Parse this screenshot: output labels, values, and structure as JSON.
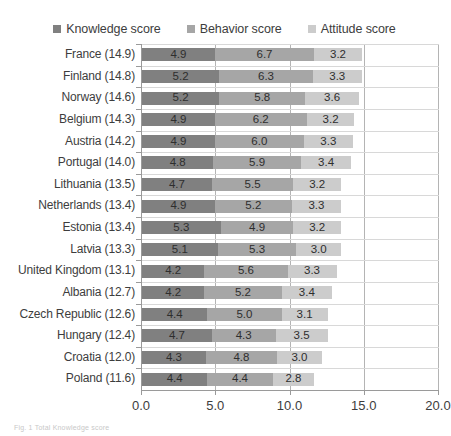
{
  "legend": {
    "items": [
      {
        "label": "Knowledge score",
        "color": "#808080",
        "key": "knowledge"
      },
      {
        "label": "Behavior score",
        "color": "#a6a6a6",
        "key": "behavior"
      },
      {
        "label": "Attitude score",
        "color": "#cccccc",
        "key": "attitude"
      }
    ]
  },
  "caption": {
    "text": "Fig. 1 Total Knowledge score"
  },
  "chart_data": {
    "type": "bar",
    "orientation": "horizontal",
    "stacked": true,
    "title": "",
    "xlabel": "",
    "ylabel": "",
    "xlim": [
      0.0,
      20.0
    ],
    "xticks": [
      "0.0",
      "5.0",
      "10.0",
      "15.0",
      "20.0"
    ],
    "xtick_values": [
      0.0,
      5.0,
      10.0,
      15.0,
      20.0
    ],
    "grid": true,
    "legend_position": "top-center",
    "categories": [
      "France (14.9)",
      "Finland (14.8)",
      "Norway (14.6)",
      "Belgium (14.3)",
      "Austria (14.2)",
      "Portugal (14.0)",
      "Lithuania (13.5)",
      "Netherlands (13.4)",
      "Estonia (13.4)",
      "Latvia (13.3)",
      "United Kingdom (13.1)",
      "Albania (12.7)",
      "Czech Republic (12.6)",
      "Hungary (12.4)",
      "Croatia (12.0)",
      "Poland (11.6)"
    ],
    "totals": [
      14.9,
      14.8,
      14.6,
      14.3,
      14.2,
      14.0,
      13.5,
      13.4,
      13.4,
      13.3,
      13.1,
      12.7,
      12.6,
      12.4,
      12.0,
      11.6
    ],
    "series": [
      {
        "name": "Knowledge score",
        "color": "#808080",
        "values": [
          4.9,
          5.2,
          5.2,
          4.9,
          4.9,
          4.8,
          4.7,
          4.9,
          5.3,
          5.1,
          4.2,
          4.2,
          4.4,
          4.7,
          4.3,
          4.4
        ],
        "labels": [
          "4.9",
          "5.2",
          "5.2",
          "4.9",
          "4.9",
          "4.8",
          "4.7",
          "4.9",
          "5.3",
          "5.1",
          "4.2",
          "4.2",
          "4.4",
          "4.7",
          "4.3",
          "4.4"
        ]
      },
      {
        "name": "Behavior score",
        "color": "#a6a6a6",
        "values": [
          6.7,
          6.3,
          5.8,
          6.2,
          6.0,
          5.9,
          5.5,
          5.2,
          4.9,
          5.3,
          5.6,
          5.2,
          5.0,
          4.3,
          4.8,
          4.4
        ],
        "labels": [
          "6.7",
          "6.3",
          "5.8",
          "6.2",
          "6.0",
          "5.9",
          "5.5",
          "5.2",
          "4.9",
          "5.3",
          "5.6",
          "5.2",
          "5.0",
          "4.3",
          "4.8",
          "4.4"
        ]
      },
      {
        "name": "Attitude score",
        "color": "#cccccc",
        "values": [
          3.2,
          3.3,
          3.6,
          3.2,
          3.3,
          3.4,
          3.2,
          3.3,
          3.2,
          3.0,
          3.3,
          3.4,
          3.1,
          3.5,
          3.0,
          2.8
        ],
        "labels": [
          "3.2",
          "3.3",
          "3.6",
          "3.2",
          "3.3",
          "3.4",
          "3.2",
          "3.3",
          "3.2",
          "3.0",
          "3.3",
          "3.4",
          "3.1",
          "3.5",
          "3.0",
          "2.8"
        ]
      }
    ]
  }
}
